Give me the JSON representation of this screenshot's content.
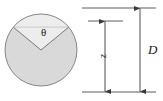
{
  "figure": {
    "type": "engineering-cross-section-diagram",
    "labels": {
      "angle": "θ",
      "depth": "z",
      "diameter": "D"
    },
    "colors": {
      "fill_shaded": "#d9d9d9",
      "fill_unshaded": "#efefef",
      "outline": "#6e6e6e",
      "dimension_line": "#444444",
      "text": "#1a1a1a",
      "background": "#ffffff"
    },
    "geometry": {
      "circle_center_x": 41,
      "circle_center_y": 50,
      "circle_radius": 36,
      "left_chord_x": 13,
      "left_chord_y": 27,
      "right_chord_x": 69,
      "right_chord_y": 27,
      "dimension_top_line_y": 8,
      "dimension_inner_top_line_y": 21,
      "dimension_bottom_line_y": 92,
      "z_arrow_x": 105,
      "d_arrow_x": 140
    }
  }
}
